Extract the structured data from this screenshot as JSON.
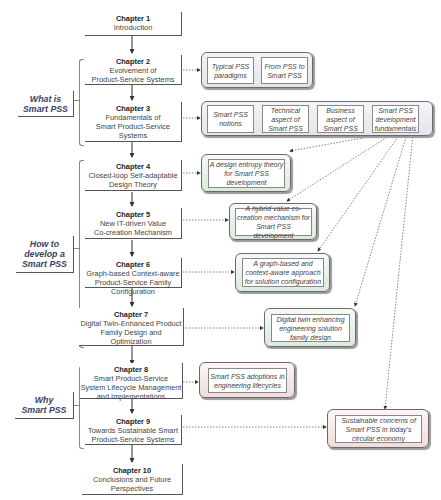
{
  "sections": [
    {
      "id": "what",
      "label": "What is\nSmart PSS"
    },
    {
      "id": "how",
      "label": "How to\ndevelop a\nSmart PSS"
    },
    {
      "id": "why",
      "label": "Why\nSmart PSS"
    }
  ],
  "chapters": [
    {
      "num": "Chapter 1",
      "title": "Introduction"
    },
    {
      "num": "Chapter 2",
      "title": "Evolvement of\nProduct-Service Systems"
    },
    {
      "num": "Chapter 3",
      "title": "Fundamentals of\nSmart Product-Service\nSystems"
    },
    {
      "num": "Chapter 4",
      "title": "Closed-loop Self-adaptable\nDesign Theory"
    },
    {
      "num": "Chapter 5",
      "title": "New IT-driven Value\nCo-creation Mechanism"
    },
    {
      "num": "Chapter 6",
      "title": "Graph-based Context-aware\nProduct-Service Family\nConfiguration"
    },
    {
      "num": "Chapter 7",
      "title": "Digital Twin-Enhanced Product\nFamily Design and Optimization"
    },
    {
      "num": "Chapter 8",
      "title": "Smart Product-Service\nSystem Lifecycle Management\nand Implementations"
    },
    {
      "num": "Chapter 9",
      "title": "Towards Sustainable Smart\nProduct-Service Systems"
    },
    {
      "num": "Chapter 10",
      "title": "Conclusions and Future\nPerspectives"
    }
  ],
  "topics": {
    "ch2": [
      "Typical PSS\nparadigms",
      "From PSS to\nSmart PSS"
    ],
    "ch3": [
      "Smart PSS\nnotions",
      "Technical\naspect of\nSmart PSS",
      "Business\naspect of\nSmart PSS",
      "Smart PSS\ndevelopment\nfundamentals"
    ],
    "ch4": "A design entropy theory\nfor Smart PSS\ndevelopment",
    "ch5": "A hybrid value co-\ncreation mechanism for\nSmart PSS development",
    "ch6": "A graph-based and\ncontext-aware approach\nfor solution configuration",
    "ch7": "Digital twin enhancing\nengineering solution\nfamily design",
    "ch8": "Smart PSS adoptions in\nengineering lifecycles",
    "ch9": "Sustainable concerns of\nSmart PSS in today's\ncircular economy"
  },
  "colors": {
    "section_text": "#3a3f6a",
    "grey_group": "#e4e4ea",
    "green_group": "#dceadc",
    "red_group": "#f0dcdb"
  }
}
